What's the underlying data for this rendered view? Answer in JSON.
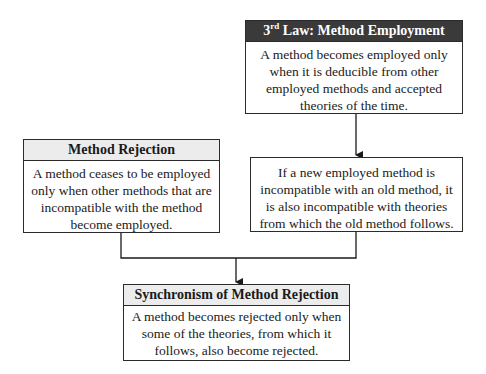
{
  "diagram": {
    "nodes": [
      {
        "id": "law3",
        "header_prefix": "3",
        "header_sup": "rd",
        "header_suffix": " Law: Method Employment",
        "header_style": "dark",
        "body": "A method becomes employed only when it is deducible from other employed methods and accepted theories of the time."
      },
      {
        "id": "method-rejection",
        "header": "Method Rejection",
        "header_style": "light",
        "body": "A method ceases to be employed only when other methods that are incompatible with the method become employed."
      },
      {
        "id": "incompatibility",
        "body": "If a new employed method is incompatible with an old method, it is also incompatible with theories from which the old method follows."
      },
      {
        "id": "synchronism",
        "header": "Synchronism of Method Rejection",
        "header_style": "light",
        "body": "A method becomes rejected only when some of the theories, from which it follows, also become rejected."
      }
    ],
    "edges": [
      {
        "from": "law3",
        "to": "incompatibility"
      },
      {
        "from": "method-rejection",
        "to": "synchronism"
      },
      {
        "from": "incompatibility",
        "to": "synchronism"
      }
    ],
    "colors": {
      "border": "#2b2b2b",
      "dark_header_bg": "#3a3a3a",
      "light_header_bg": "#ececec"
    }
  }
}
